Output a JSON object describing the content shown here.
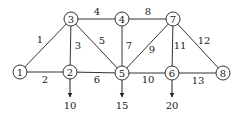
{
  "diagram": {
    "type": "network-graph",
    "nodes": [
      {
        "id": "1",
        "label": "1",
        "x": 20,
        "y": 72
      },
      {
        "id": "2",
        "label": "2",
        "x": 70,
        "y": 72
      },
      {
        "id": "3",
        "label": "3",
        "x": 71,
        "y": 19
      },
      {
        "id": "4",
        "label": "4",
        "x": 122,
        "y": 19
      },
      {
        "id": "5",
        "label": "5",
        "x": 122,
        "y": 73
      },
      {
        "id": "6",
        "label": "6",
        "x": 172,
        "y": 73
      },
      {
        "id": "7",
        "label": "7",
        "x": 173,
        "y": 19
      },
      {
        "id": "8",
        "label": "8",
        "x": 223,
        "y": 73
      }
    ],
    "edges": [
      {
        "label": "1",
        "from": "1",
        "to": "3",
        "lx": 40,
        "ly": 43
      },
      {
        "label": "2",
        "from": "1",
        "to": "2",
        "lx": 45,
        "ly": 83
      },
      {
        "label": "3",
        "from": "3",
        "to": "2",
        "lx": 78,
        "ly": 49
      },
      {
        "label": "4",
        "from": "3",
        "to": "4",
        "lx": 97,
        "ly": 15
      },
      {
        "label": "5",
        "from": "3",
        "to": "5",
        "lx": 102,
        "ly": 44
      },
      {
        "label": "6",
        "from": "2",
        "to": "5",
        "lx": 97,
        "ly": 83
      },
      {
        "label": "7",
        "from": "4",
        "to": "5",
        "lx": 129,
        "ly": 49
      },
      {
        "label": "8",
        "from": "4",
        "to": "7",
        "lx": 148,
        "ly": 15
      },
      {
        "label": "9",
        "from": "5",
        "to": "7",
        "lx": 152,
        "ly": 53
      },
      {
        "label": "10",
        "from": "5",
        "to": "6",
        "lx": 148,
        "ly": 83
      },
      {
        "label": "11",
        "from": "7",
        "to": "6",
        "lx": 180,
        "ly": 49
      },
      {
        "label": "12",
        "from": "7",
        "to": "8",
        "lx": 204,
        "ly": 44
      },
      {
        "label": "13",
        "from": "6",
        "to": "8",
        "lx": 198,
        "ly": 84
      }
    ],
    "demands": [
      {
        "node": "2",
        "label": "10",
        "x": 70,
        "y1": 79,
        "y2": 97,
        "ty": 109
      },
      {
        "node": "5",
        "label": "15",
        "x": 122,
        "y1": 80,
        "y2": 97,
        "ty": 109
      },
      {
        "node": "6",
        "label": "20",
        "x": 172,
        "y1": 80,
        "y2": 97,
        "ty": 109
      }
    ]
  }
}
